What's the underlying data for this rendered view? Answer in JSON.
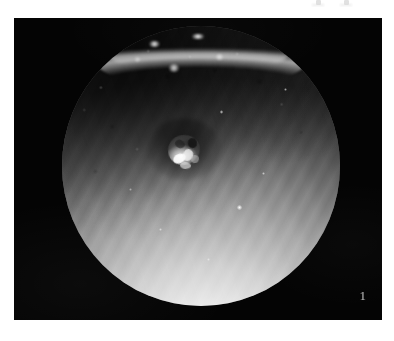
{
  "page": {
    "background_color": "#ffffff",
    "width": 394,
    "height": 341
  },
  "top_margin": {
    "clipped_text_remnants": "",
    "description": "faint bottoms of two clipped characters at the very top right edge"
  },
  "figure": {
    "plate_background_color": "#040404",
    "label": "1",
    "caption": "",
    "modality_note": "grayscale circular endoscopic view",
    "field_of_view": {
      "shape": "circle",
      "center_x": 199,
      "center_y": 166,
      "diameter": 278,
      "bright_region": "inferior / lower-right",
      "dark_region": "superior-left",
      "specular_highlight": "crescent arc along superior rim",
      "central_finding": "irregular pale raised lesion at center"
    },
    "colors": {
      "plate": "#040404",
      "fov_bright": "#ffffff",
      "fov_mid": "#8a8a8a",
      "fov_dark": "#2a2a2a",
      "label": "#cfcfcf"
    }
  }
}
